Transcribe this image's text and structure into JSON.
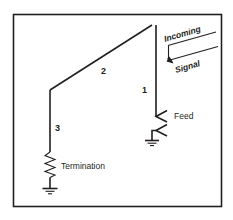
{
  "figure": {
    "frame": {
      "color": "#231f20"
    },
    "labels": {
      "segment1": "1",
      "segment2": "2",
      "segment3": "3",
      "feed": "Feed",
      "termination": "Termination",
      "incoming": "Incoming",
      "signal": "Signal"
    },
    "symbols": {
      "resistor": "resistor-zigzag",
      "ground_termination": "ground-symbol",
      "ground_feed": "ground-symbol",
      "feed_upper": "feed-connector",
      "feed_lower": "feed-connector",
      "direction_arrow": "arrow-down-left"
    },
    "colors": {
      "ink": "#231f20",
      "background": "#ffffff"
    }
  }
}
